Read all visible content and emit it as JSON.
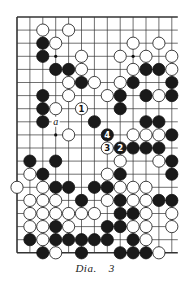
{
  "diagram": {
    "type": "go-board-fragment",
    "grid": {
      "columns": 13,
      "rows": 19,
      "open_right_edge": true,
      "edges": [
        "top",
        "left",
        "bottom"
      ]
    },
    "colors": {
      "black": "#1a1a1a",
      "white": "#ffffff",
      "line": "#333333"
    },
    "star_points": [
      [
        3,
        3
      ],
      [
        3,
        9
      ],
      [
        9,
        3
      ]
    ],
    "stones": [
      {
        "r": 1,
        "c": 2,
        "color": "W"
      },
      {
        "r": 1,
        "c": 4,
        "color": "W"
      },
      {
        "r": 2,
        "c": 2,
        "color": "B"
      },
      {
        "r": 2,
        "c": 3,
        "color": "W"
      },
      {
        "r": 2,
        "c": 9,
        "color": "W"
      },
      {
        "r": 2,
        "c": 11,
        "color": "W"
      },
      {
        "r": 3,
        "c": 2,
        "color": "B"
      },
      {
        "r": 3,
        "c": 5,
        "color": "W"
      },
      {
        "r": 3,
        "c": 8,
        "color": "W"
      },
      {
        "r": 3,
        "c": 10,
        "color": "W"
      },
      {
        "r": 3,
        "c": 12,
        "color": "W"
      },
      {
        "r": 4,
        "c": 3,
        "color": "B"
      },
      {
        "r": 4,
        "c": 4,
        "color": "B"
      },
      {
        "r": 4,
        "c": 5,
        "color": "W"
      },
      {
        "r": 4,
        "c": 9,
        "color": "W"
      },
      {
        "r": 4,
        "c": 10,
        "color": "B"
      },
      {
        "r": 4,
        "c": 11,
        "color": "B"
      },
      {
        "r": 4,
        "c": 12,
        "color": "W"
      },
      {
        "r": 5,
        "c": 4,
        "color": "W"
      },
      {
        "r": 5,
        "c": 5,
        "color": "B"
      },
      {
        "r": 5,
        "c": 6,
        "color": "W"
      },
      {
        "r": 5,
        "c": 8,
        "color": "W"
      },
      {
        "r": 5,
        "c": 9,
        "color": "B"
      },
      {
        "r": 5,
        "c": 12,
        "color": "B"
      },
      {
        "r": 6,
        "c": 2,
        "color": "B"
      },
      {
        "r": 6,
        "c": 4,
        "color": "W"
      },
      {
        "r": 6,
        "c": 7,
        "color": "W"
      },
      {
        "r": 6,
        "c": 8,
        "color": "B"
      },
      {
        "r": 6,
        "c": 10,
        "color": "B"
      },
      {
        "r": 6,
        "c": 11,
        "color": "W"
      },
      {
        "r": 6,
        "c": 12,
        "color": "B"
      },
      {
        "r": 7,
        "c": 2,
        "color": "B"
      },
      {
        "r": 7,
        "c": 3,
        "color": "W"
      },
      {
        "r": 7,
        "c": 5,
        "color": "W",
        "label": "1"
      },
      {
        "r": 7,
        "c": 8,
        "color": "B"
      },
      {
        "r": 8,
        "c": 2,
        "color": "B"
      },
      {
        "r": 8,
        "c": 6,
        "color": "B"
      },
      {
        "r": 8,
        "c": 10,
        "color": "B"
      },
      {
        "r": 8,
        "c": 11,
        "color": "B"
      },
      {
        "r": 9,
        "c": 4,
        "color": "W"
      },
      {
        "r": 9,
        "c": 7,
        "color": "B",
        "label": "4"
      },
      {
        "r": 9,
        "c": 9,
        "color": "W"
      },
      {
        "r": 9,
        "c": 10,
        "color": "W"
      },
      {
        "r": 9,
        "c": 11,
        "color": "W"
      },
      {
        "r": 9,
        "c": 12,
        "color": "B"
      },
      {
        "r": 10,
        "c": 7,
        "color": "W",
        "label": "3"
      },
      {
        "r": 10,
        "c": 8,
        "color": "B",
        "label": "2"
      },
      {
        "r": 10,
        "c": 9,
        "color": "B"
      },
      {
        "r": 10,
        "c": 10,
        "color": "B"
      },
      {
        "r": 10,
        "c": 11,
        "color": "B"
      },
      {
        "r": 11,
        "c": 1,
        "color": "B"
      },
      {
        "r": 11,
        "c": 3,
        "color": "B"
      },
      {
        "r": 11,
        "c": 8,
        "color": "W"
      },
      {
        "r": 11,
        "c": 11,
        "color": "W"
      },
      {
        "r": 11,
        "c": 12,
        "color": "B"
      },
      {
        "r": 12,
        "c": 1,
        "color": "W"
      },
      {
        "r": 12,
        "c": 2,
        "color": "B"
      },
      {
        "r": 12,
        "c": 7,
        "color": "W"
      },
      {
        "r": 12,
        "c": 8,
        "color": "B"
      },
      {
        "r": 12,
        "c": 12,
        "color": "B"
      },
      {
        "r": 13,
        "c": 0,
        "color": "W"
      },
      {
        "r": 13,
        "c": 2,
        "color": "W"
      },
      {
        "r": 13,
        "c": 3,
        "color": "B"
      },
      {
        "r": 13,
        "c": 4,
        "color": "B"
      },
      {
        "r": 13,
        "c": 6,
        "color": "B"
      },
      {
        "r": 13,
        "c": 7,
        "color": "B"
      },
      {
        "r": 13,
        "c": 8,
        "color": "W"
      },
      {
        "r": 13,
        "c": 9,
        "color": "W"
      },
      {
        "r": 13,
        "c": 10,
        "color": "W"
      },
      {
        "r": 14,
        "c": 1,
        "color": "W"
      },
      {
        "r": 14,
        "c": 2,
        "color": "W"
      },
      {
        "r": 14,
        "c": 3,
        "color": "W"
      },
      {
        "r": 14,
        "c": 5,
        "color": "B"
      },
      {
        "r": 14,
        "c": 7,
        "color": "W"
      },
      {
        "r": 14,
        "c": 8,
        "color": "B"
      },
      {
        "r": 14,
        "c": 9,
        "color": "W"
      },
      {
        "r": 14,
        "c": 10,
        "color": "W"
      },
      {
        "r": 14,
        "c": 11,
        "color": "B"
      },
      {
        "r": 14,
        "c": 12,
        "color": "B"
      },
      {
        "r": 15,
        "c": 1,
        "color": "W"
      },
      {
        "r": 15,
        "c": 2,
        "color": "W"
      },
      {
        "r": 15,
        "c": 3,
        "color": "W"
      },
      {
        "r": 15,
        "c": 4,
        "color": "W"
      },
      {
        "r": 15,
        "c": 5,
        "color": "W"
      },
      {
        "r": 15,
        "c": 6,
        "color": "W"
      },
      {
        "r": 15,
        "c": 8,
        "color": "B"
      },
      {
        "r": 15,
        "c": 9,
        "color": "B"
      },
      {
        "r": 15,
        "c": 10,
        "color": "W"
      },
      {
        "r": 15,
        "c": 12,
        "color": "W"
      },
      {
        "r": 16,
        "c": 1,
        "color": "W"
      },
      {
        "r": 16,
        "c": 2,
        "color": "W"
      },
      {
        "r": 16,
        "c": 3,
        "color": "B"
      },
      {
        "r": 16,
        "c": 4,
        "color": "W"
      },
      {
        "r": 16,
        "c": 7,
        "color": "B"
      },
      {
        "r": 16,
        "c": 8,
        "color": "B"
      },
      {
        "r": 16,
        "c": 9,
        "color": "W"
      },
      {
        "r": 16,
        "c": 10,
        "color": "W"
      },
      {
        "r": 16,
        "c": 12,
        "color": "W"
      },
      {
        "r": 17,
        "c": 1,
        "color": "B"
      },
      {
        "r": 17,
        "c": 2,
        "color": "W"
      },
      {
        "r": 17,
        "c": 3,
        "color": "B"
      },
      {
        "r": 17,
        "c": 4,
        "color": "B"
      },
      {
        "r": 17,
        "c": 5,
        "color": "B"
      },
      {
        "r": 17,
        "c": 6,
        "color": "B"
      },
      {
        "r": 17,
        "c": 7,
        "color": "B"
      },
      {
        "r": 17,
        "c": 9,
        "color": "B"
      },
      {
        "r": 17,
        "c": 10,
        "color": "W"
      },
      {
        "r": 18,
        "c": 2,
        "color": "B"
      },
      {
        "r": 18,
        "c": 3,
        "color": "W"
      },
      {
        "r": 18,
        "c": 5,
        "color": "B"
      },
      {
        "r": 18,
        "c": 8,
        "color": "B"
      },
      {
        "r": 18,
        "c": 9,
        "color": "B"
      },
      {
        "r": 18,
        "c": 10,
        "color": "B"
      },
      {
        "r": 18,
        "c": 11,
        "color": "W"
      }
    ],
    "markers": [
      {
        "r": 8,
        "c": 3,
        "text": "a"
      }
    ]
  },
  "caption": {
    "label": "Dia.",
    "number": "3"
  }
}
